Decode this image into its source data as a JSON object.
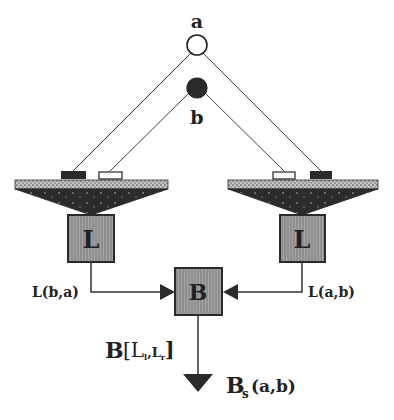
{
  "nodes": {
    "a": {
      "label": "a"
    },
    "b": {
      "label": "b"
    }
  },
  "left_unit": {
    "box_label": "L",
    "output_label": "L(b,a)"
  },
  "right_unit": {
    "box_label": "L",
    "output_label": "L(a,b)"
  },
  "binaural": {
    "box_label": "B",
    "output_label_main": "B",
    "output_label_args": "[L",
    "output_sub_l": "l",
    "output_comma": ",L",
    "output_sub_r": "r",
    "output_close": "]"
  },
  "final_output": {
    "main": "B",
    "sub": "s",
    "args": "(a,b)"
  },
  "colors": {
    "line": "#333333",
    "box_fill": "#8a8a8a",
    "box_stroke": "#2a2a2a",
    "dark": "#2e2e2e",
    "platform_bar": "#b8b8b8"
  }
}
